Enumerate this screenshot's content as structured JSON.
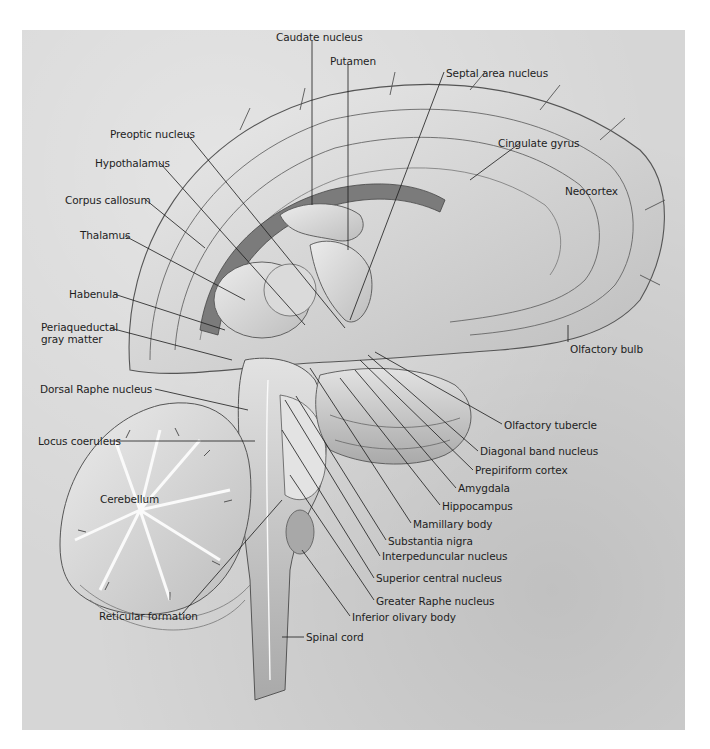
{
  "figure": {
    "background_color": "#d6d6d6",
    "labels": [
      {
        "id": "caudate",
        "text": "Caudate nucleus",
        "x": 276,
        "y": 31
      },
      {
        "id": "putamen",
        "text": "Putamen",
        "x": 330,
        "y": 55
      },
      {
        "id": "septal",
        "text": "Septal area nucleus",
        "x": 444,
        "y": 67
      },
      {
        "id": "preoptic",
        "text": "Preoptic nucleus",
        "x": 110,
        "y": 128
      },
      {
        "id": "cingulate",
        "text": "Cingulate gyrus",
        "x": 498,
        "y": 137
      },
      {
        "id": "hypothalamus",
        "text": "Hypothalamus",
        "x": 95,
        "y": 157
      },
      {
        "id": "neocortex",
        "text": "Neocortex",
        "x": 565,
        "y": 185
      },
      {
        "id": "corpus",
        "text": "Corpus callosum",
        "x": 65,
        "y": 194
      },
      {
        "id": "thalamus",
        "text": "Thalamus",
        "x": 80,
        "y": 229
      },
      {
        "id": "habenula",
        "text": "Habenula",
        "x": 69,
        "y": 288
      },
      {
        "id": "periaqueductal",
        "text": "Periaqueductal\ngray matter",
        "x": 41,
        "y": 321
      },
      {
        "id": "olfactory_bulb",
        "text": "Olfactory bulb",
        "x": 570,
        "y": 343
      },
      {
        "id": "dorsal_raphe",
        "text": "Dorsal Raphe nucleus",
        "x": 40,
        "y": 383
      },
      {
        "id": "locus",
        "text": "Locus coeruleus",
        "x": 38,
        "y": 435
      },
      {
        "id": "olfactory_tubercle",
        "text": "Olfactory tubercle",
        "x": 504,
        "y": 419
      },
      {
        "id": "diagonal",
        "text": "Diagonal band nucleus",
        "x": 480,
        "y": 445
      },
      {
        "id": "prepiriform",
        "text": "Prepiriform cortex",
        "x": 475,
        "y": 464
      },
      {
        "id": "amygdala",
        "text": "Amygdala",
        "x": 458,
        "y": 482
      },
      {
        "id": "hippocampus",
        "text": "Hippocampus",
        "x": 442,
        "y": 500
      },
      {
        "id": "cerebellum",
        "text": "Cerebellum",
        "x": 100,
        "y": 493
      },
      {
        "id": "mamillary",
        "text": "Mamillary body",
        "x": 413,
        "y": 518
      },
      {
        "id": "substantia",
        "text": "Substantia nigra",
        "x": 388,
        "y": 535
      },
      {
        "id": "interpeduncular",
        "text": "Interpeduncular nucleus",
        "x": 382,
        "y": 550
      },
      {
        "id": "superior_central",
        "text": "Superior central nucleus",
        "x": 376,
        "y": 572
      },
      {
        "id": "greater_raphe",
        "text": "Greater Raphe nucleus",
        "x": 376,
        "y": 595
      },
      {
        "id": "inferior_olivary",
        "text": "Inferior olivary body",
        "x": 352,
        "y": 611
      },
      {
        "id": "reticular",
        "text": "Reticular formation",
        "x": 99,
        "y": 610
      },
      {
        "id": "spinal",
        "text": "Spinal cord",
        "x": 306,
        "y": 631
      }
    ]
  }
}
